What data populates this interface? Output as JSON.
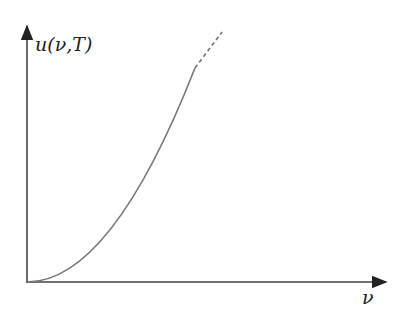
{
  "diagram": {
    "title": "",
    "y_axis_label": "u(ν,T)",
    "x_axis_label": "ν",
    "curve": {
      "type": "quadratic",
      "formula": "u ∝ ν²",
      "solid_end_x": 195,
      "dashed_end_x": 222
    },
    "colors": {
      "axis": "#333333",
      "curve": "#777777"
    }
  }
}
